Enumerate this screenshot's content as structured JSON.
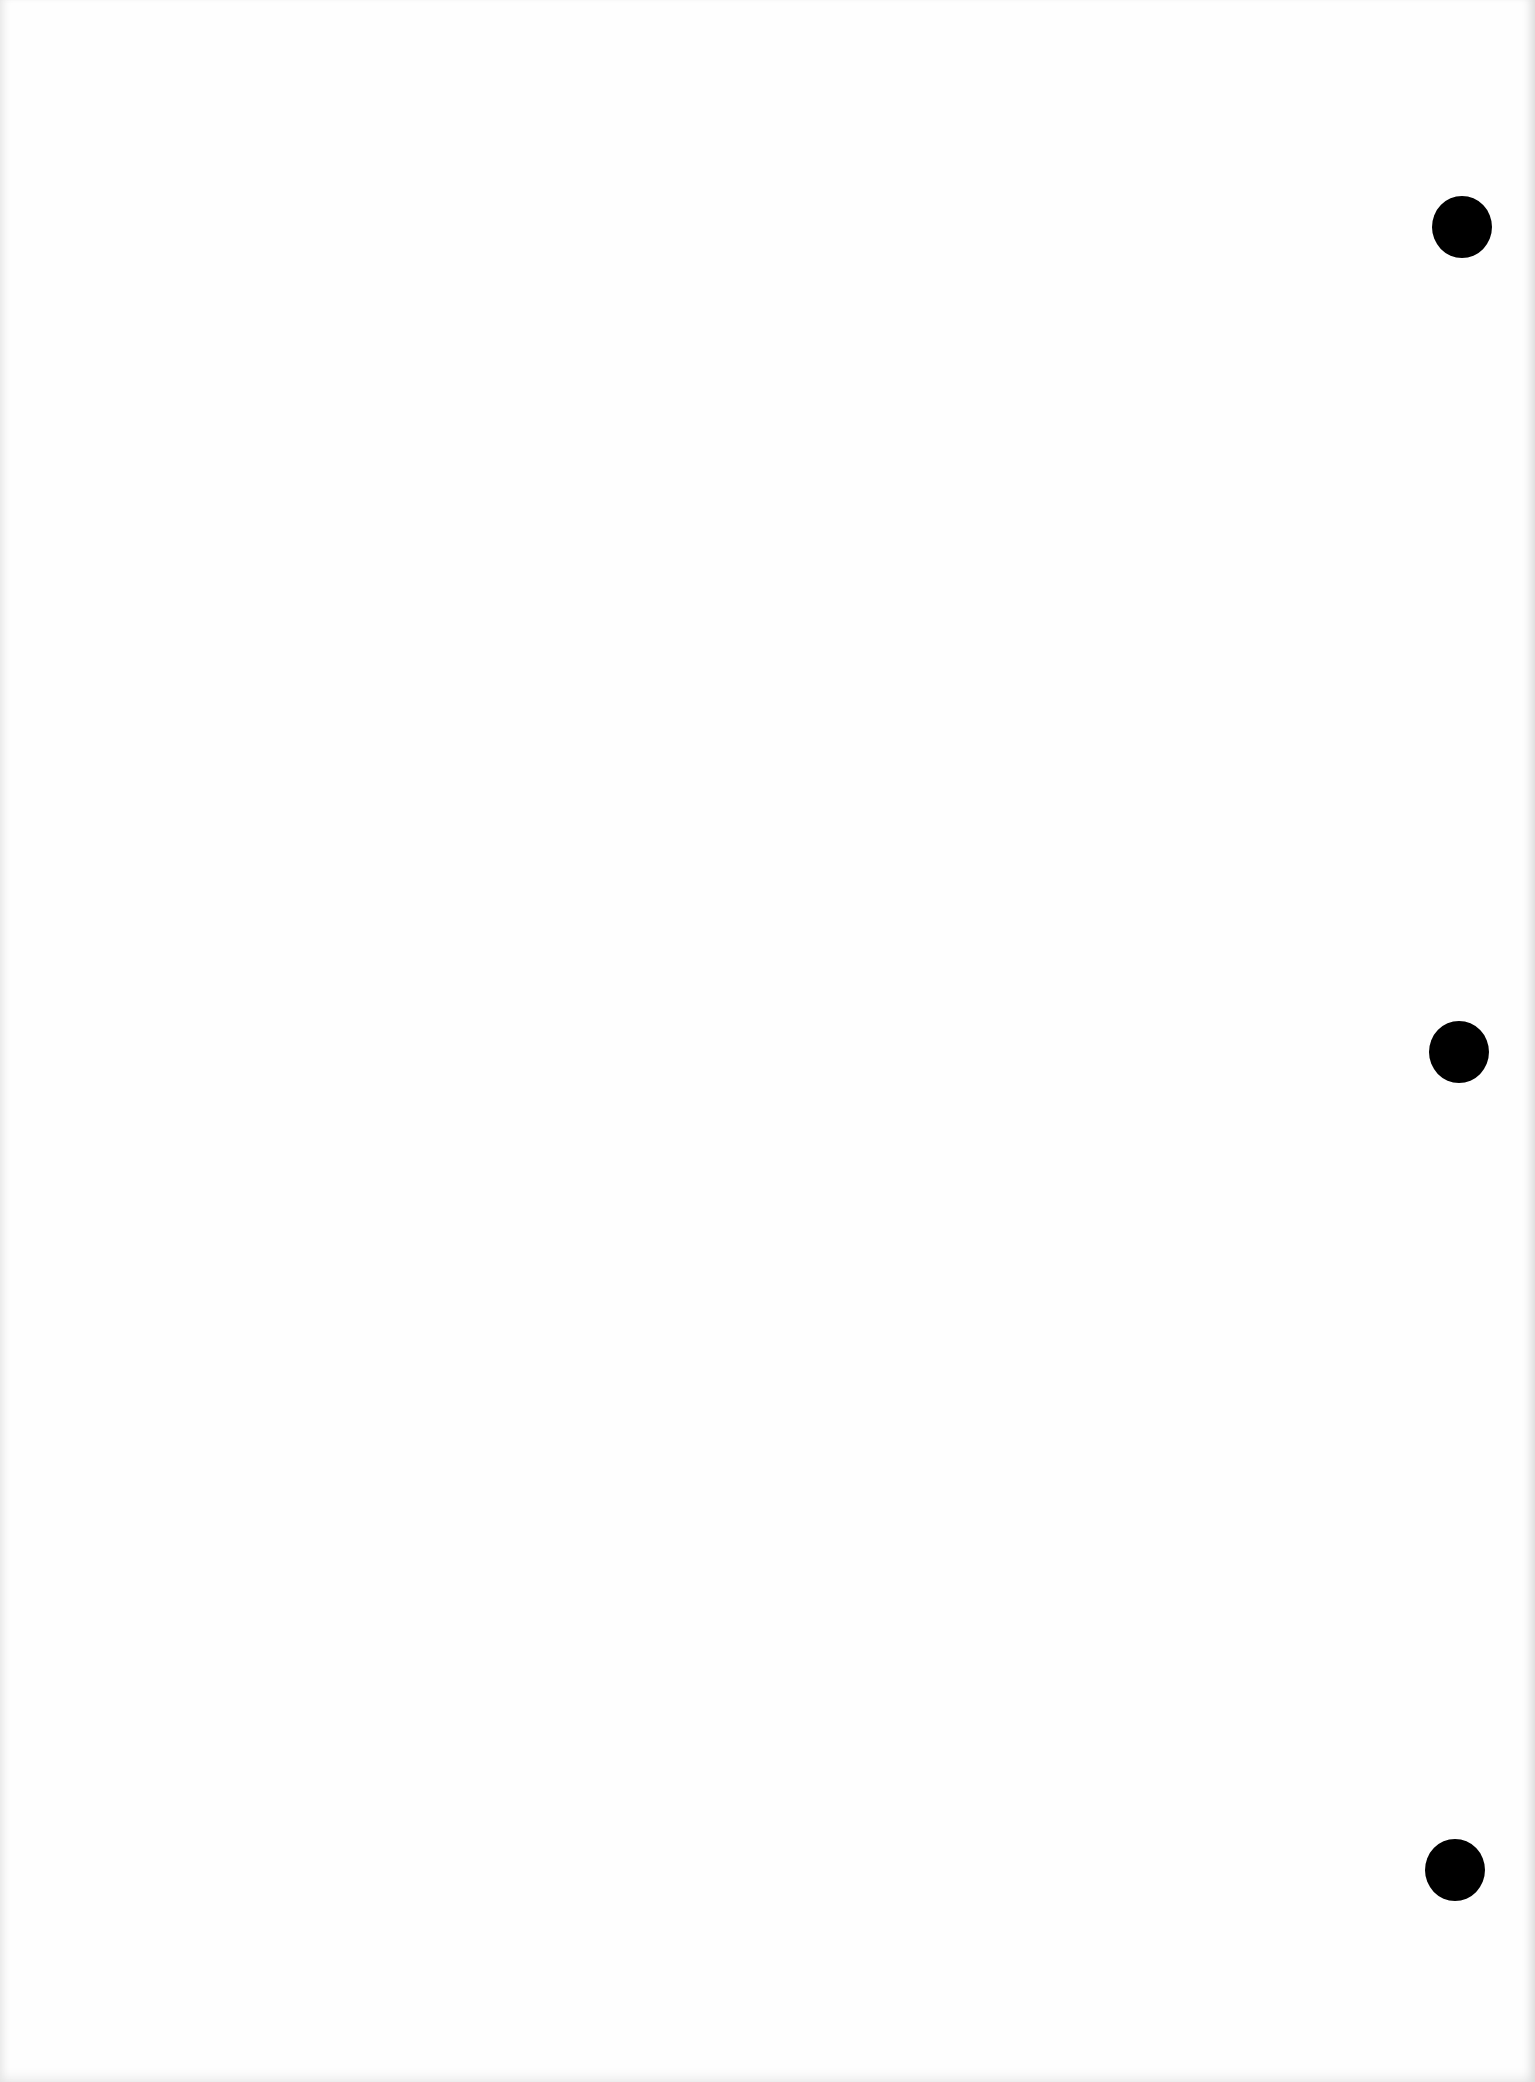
{
  "document": {
    "type": "blank hole-punched paper sheet",
    "background_color": "#fefefe",
    "text": ""
  },
  "punch_holes": [
    {
      "cx": 1462,
      "cy": 227,
      "w": 60,
      "h": 62,
      "color": "#000000"
    },
    {
      "cx": 1459,
      "cy": 1052,
      "w": 60,
      "h": 62,
      "color": "#000000"
    },
    {
      "cx": 1455,
      "cy": 1870,
      "w": 60,
      "h": 62,
      "color": "#000000"
    }
  ]
}
